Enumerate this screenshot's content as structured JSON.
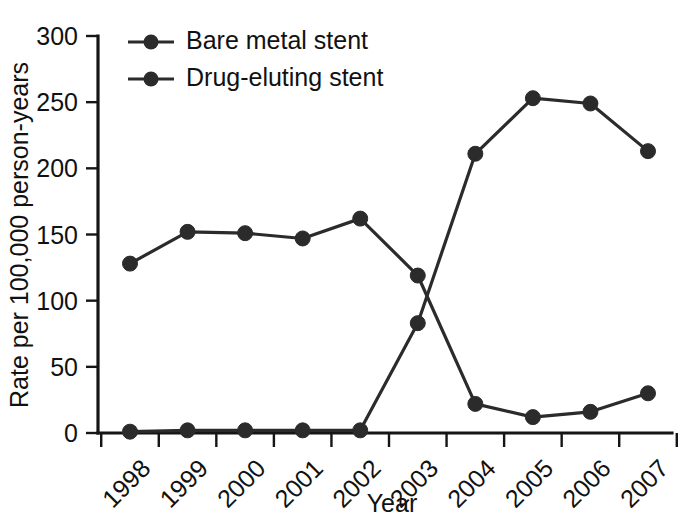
{
  "chart_data": {
    "type": "line",
    "title": "",
    "xlabel": "Year",
    "ylabel": "Rate per 100,000 person-years",
    "categories": [
      "1998",
      "1999",
      "2000",
      "2001",
      "2002",
      "2003",
      "2004",
      "2005",
      "2006",
      "2007"
    ],
    "x": [
      1998,
      1999,
      2000,
      2001,
      2002,
      2003,
      2004,
      2005,
      2006,
      2007
    ],
    "series": [
      {
        "name": "Bare metal stent",
        "values": [
          128,
          152,
          151,
          147,
          162,
          119,
          22,
          12,
          16,
          30
        ],
        "marker": "circle",
        "color": "#2b2b2b"
      },
      {
        "name": "Drug-eluting stent",
        "values": [
          1,
          2,
          2,
          2,
          2,
          83,
          211,
          253,
          249,
          213
        ],
        "marker": "circle",
        "color": "#2b2b2b"
      }
    ],
    "ylim": [
      0,
      300
    ],
    "yticks": [
      0,
      50,
      100,
      150,
      200,
      250,
      300
    ],
    "ytick_labels": [
      "0",
      "50",
      "100",
      "150",
      "200",
      "250",
      "300"
    ],
    "xtick_labels": [
      "1998",
      "1999",
      "2000",
      "2001",
      "2002",
      "2003",
      "2004",
      "2005",
      "2006",
      "2007"
    ],
    "xtick_rotation_degrees": -45,
    "grid": false,
    "legend_position": "top-left",
    "legend": [
      "Bare metal stent",
      "Drug-eluting stent"
    ]
  },
  "figure": {
    "background_color": "#ffffff",
    "foreground_color": "#111111",
    "series_color": "#2b2b2b"
  }
}
